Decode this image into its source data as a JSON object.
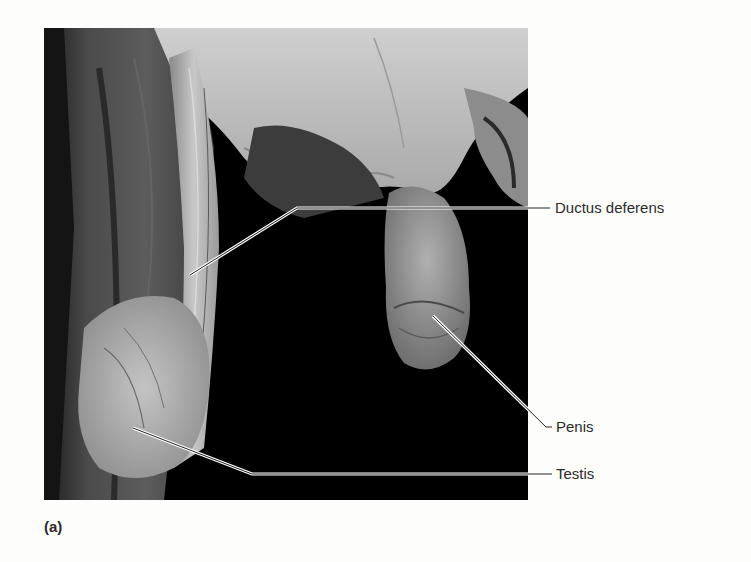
{
  "figure": {
    "panel_label": "(a)",
    "background_color": "#fdfdfb",
    "photo_background_color": "#000000",
    "labels": [
      {
        "id": "ductus-deferens",
        "text": "Ductus deferens"
      },
      {
        "id": "penis",
        "text": "Penis"
      },
      {
        "id": "testis",
        "text": "Testis"
      }
    ]
  }
}
